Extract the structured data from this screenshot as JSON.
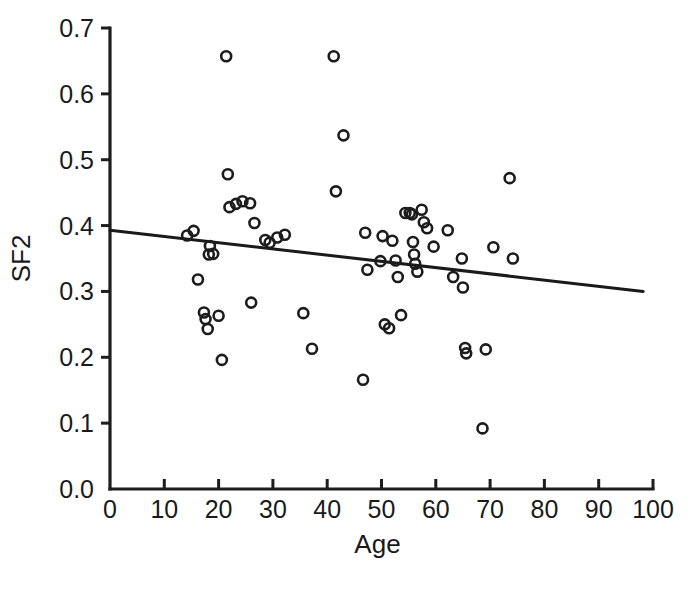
{
  "figure": {
    "background_color": "#ffffff",
    "ink_color": "#1a1a1a",
    "clipped_caption": ""
  },
  "chart_data": {
    "type": "scatter",
    "title": "",
    "xlabel": "Age",
    "ylabel": "SF2",
    "xlim": [
      0,
      100
    ],
    "ylim": [
      0.0,
      0.7
    ],
    "xticks": [
      0,
      10,
      20,
      30,
      40,
      50,
      60,
      70,
      80,
      90,
      100
    ],
    "xticklabels": [
      "0",
      "10",
      "20",
      "30",
      "40",
      "50",
      "60",
      "70",
      "80",
      "90",
      "100"
    ],
    "yticks": [
      0.0,
      0.1,
      0.2,
      0.3,
      0.4,
      0.5,
      0.6,
      0.7
    ],
    "yticklabels": [
      "0.0",
      "0.1",
      "0.2",
      "0.3",
      "0.4",
      "0.5",
      "0.6",
      "0.7"
    ],
    "grid": false,
    "legend": null,
    "marker": "open-circle",
    "marker_color": "#1c1c1c",
    "points": [
      {
        "x": 14.2,
        "y": 0.385
      },
      {
        "x": 15.4,
        "y": 0.392
      },
      {
        "x": 16.2,
        "y": 0.318
      },
      {
        "x": 17.3,
        "y": 0.268
      },
      {
        "x": 17.6,
        "y": 0.258
      },
      {
        "x": 18.0,
        "y": 0.243
      },
      {
        "x": 18.2,
        "y": 0.356
      },
      {
        "x": 18.4,
        "y": 0.369
      },
      {
        "x": 19.0,
        "y": 0.357
      },
      {
        "x": 20.0,
        "y": 0.263
      },
      {
        "x": 20.6,
        "y": 0.196
      },
      {
        "x": 21.4,
        "y": 0.657
      },
      {
        "x": 21.7,
        "y": 0.478
      },
      {
        "x": 22.0,
        "y": 0.428
      },
      {
        "x": 23.2,
        "y": 0.433
      },
      {
        "x": 24.4,
        "y": 0.437
      },
      {
        "x": 25.8,
        "y": 0.434
      },
      {
        "x": 26.0,
        "y": 0.283
      },
      {
        "x": 26.6,
        "y": 0.404
      },
      {
        "x": 28.6,
        "y": 0.378
      },
      {
        "x": 29.4,
        "y": 0.374
      },
      {
        "x": 30.8,
        "y": 0.382
      },
      {
        "x": 32.2,
        "y": 0.386
      },
      {
        "x": 35.6,
        "y": 0.267
      },
      {
        "x": 37.2,
        "y": 0.213
      },
      {
        "x": 41.2,
        "y": 0.657
      },
      {
        "x": 41.6,
        "y": 0.452
      },
      {
        "x": 43.0,
        "y": 0.537
      },
      {
        "x": 46.6,
        "y": 0.166
      },
      {
        "x": 47.0,
        "y": 0.389
      },
      {
        "x": 47.4,
        "y": 0.333
      },
      {
        "x": 49.8,
        "y": 0.346
      },
      {
        "x": 50.2,
        "y": 0.384
      },
      {
        "x": 50.6,
        "y": 0.25
      },
      {
        "x": 51.4,
        "y": 0.244
      },
      {
        "x": 52.0,
        "y": 0.377
      },
      {
        "x": 52.6,
        "y": 0.347
      },
      {
        "x": 53.0,
        "y": 0.322
      },
      {
        "x": 53.6,
        "y": 0.264
      },
      {
        "x": 54.4,
        "y": 0.419
      },
      {
        "x": 55.2,
        "y": 0.419
      },
      {
        "x": 55.6,
        "y": 0.417
      },
      {
        "x": 55.8,
        "y": 0.375
      },
      {
        "x": 56.0,
        "y": 0.356
      },
      {
        "x": 56.2,
        "y": 0.342
      },
      {
        "x": 56.6,
        "y": 0.33
      },
      {
        "x": 57.4,
        "y": 0.424
      },
      {
        "x": 57.8,
        "y": 0.405
      },
      {
        "x": 58.4,
        "y": 0.396
      },
      {
        "x": 59.6,
        "y": 0.368
      },
      {
        "x": 62.2,
        "y": 0.393
      },
      {
        "x": 63.2,
        "y": 0.322
      },
      {
        "x": 64.8,
        "y": 0.35
      },
      {
        "x": 65.0,
        "y": 0.306
      },
      {
        "x": 65.4,
        "y": 0.214
      },
      {
        "x": 65.6,
        "y": 0.206
      },
      {
        "x": 68.6,
        "y": 0.092
      },
      {
        "x": 69.2,
        "y": 0.212
      },
      {
        "x": 70.6,
        "y": 0.367
      },
      {
        "x": 73.6,
        "y": 0.472
      },
      {
        "x": 74.2,
        "y": 0.35
      }
    ],
    "fit_line": {
      "label": "",
      "x_start": 0.0,
      "y_start": 0.393,
      "x_end": 98.2,
      "y_end": 0.3,
      "slope": -0.000947,
      "intercept": 0.393
    }
  }
}
